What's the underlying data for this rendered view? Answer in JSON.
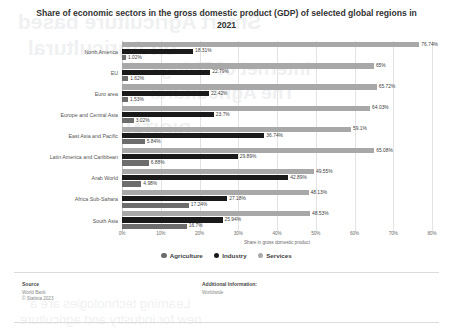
{
  "chart_data": {
    "type": "bar",
    "orientation": "horizontal",
    "title": "Share of economic sectors in the gross domestic product (GDP) of selected global regions in 2021",
    "xlabel": "Share in gross domestic product",
    "ylabel": "",
    "xlim": [
      0,
      80
    ],
    "xticks": [
      "0%",
      "10%",
      "20%",
      "30%",
      "40%",
      "50%",
      "60%",
      "70%",
      "80%"
    ],
    "xtick_values": [
      0,
      10,
      20,
      30,
      40,
      50,
      60,
      70,
      80
    ],
    "grid": true,
    "legend_position": "bottom",
    "categories": [
      "North America",
      "EU",
      "Euro area",
      "Europe and Central Asia",
      "East Asia and Pacific",
      "Latin America and Caribbean",
      "Arab World",
      "Africa Sub-Sahara",
      "South Asia"
    ],
    "series": [
      {
        "name": "Agriculture",
        "color": "#6d6d6d",
        "values": [
          1.02,
          1.62,
          1.53,
          3.02,
          5.84,
          6.88,
          4.98,
          17.24,
          16.7
        ],
        "labels": [
          "1.02%",
          "1.62%",
          "1.53%",
          "3.02%",
          "5.84%",
          "6.88%",
          "4.98%",
          "17.24%",
          "16.7%"
        ]
      },
      {
        "name": "Industry",
        "color": "#1a1a1a",
        "values": [
          18.31,
          22.79,
          22.42,
          23.7,
          36.74,
          29.89,
          42.89,
          27.18,
          25.94
        ],
        "labels": [
          "18.31%",
          "22.79%",
          "22.42%",
          "23.7%",
          "36.74%",
          "29.89%",
          "42.89%",
          "27.18%",
          "25.94%"
        ]
      },
      {
        "name": "Services",
        "color": "#a8a8a8",
        "values": [
          76.74,
          65,
          65.72,
          64.03,
          59.1,
          65.08,
          49.55,
          48.13,
          48.53
        ],
        "labels": [
          "76.74%",
          "65%",
          "65.72%",
          "64.03%",
          "59.1%",
          "65.08%",
          "49.55%",
          "48.13%",
          "48.53%"
        ]
      }
    ]
  },
  "footer": {
    "source_head": "Source",
    "source_lines": [
      "World Bank",
      "© Statista 2023"
    ],
    "info_head": "Additional Information:",
    "info_lines": [
      "Worldwide"
    ]
  },
  "ghost_text": {
    "l1": "Smart Agriculture based",
    "l2": "on Agricultural",
    "l3": "Internet of Things",
    "l4": "The Agricultural",
    "l5": "DIGITAL",
    "l6": "Learning technologies are a",
    "l7": "new for industry and agriculture"
  }
}
